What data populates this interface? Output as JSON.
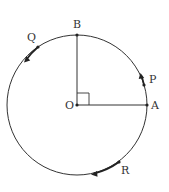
{
  "diagram": {
    "type": "geometry",
    "colors": {
      "stroke": "#333333",
      "background": "#ffffff"
    },
    "circle": {
      "cx": 77,
      "cy": 105,
      "r": 70
    },
    "points": [
      {
        "id": "O",
        "label": "O",
        "x": 77,
        "y": 105,
        "label_x": 66,
        "label_y": 109
      },
      {
        "id": "A",
        "label": "A",
        "x": 147,
        "y": 105,
        "label_x": 151,
        "label_y": 109
      },
      {
        "id": "B",
        "label": "B",
        "x": 77,
        "y": 35,
        "label_x": 73,
        "label_y": 28
      },
      {
        "id": "P",
        "label": "P",
        "x": 144,
        "y": 85,
        "label_x": 149,
        "label_y": 83
      },
      {
        "id": "Q",
        "label": "Q",
        "x": 38,
        "y": 47,
        "label_x": 27,
        "label_y": 41
      },
      {
        "id": "R",
        "label": "R",
        "x": 119,
        "y": 162,
        "label_x": 121,
        "label_y": 174
      }
    ],
    "segments": [
      {
        "from": "O",
        "to": "A"
      },
      {
        "from": "O",
        "to": "B"
      }
    ],
    "right_angle_marker": {
      "at": "O",
      "size": 12
    },
    "motion_arrows": [
      {
        "point": "P",
        "direction": "counterclockwise",
        "tip_x": 141.5,
        "tip_y": 76
      },
      {
        "point": "Q",
        "direction": "counterclockwise",
        "tip_x": 25,
        "tip_y": 61
      },
      {
        "point": "R",
        "direction": "clockwise",
        "tip_x": 92,
        "tip_y": 174
      }
    ]
  }
}
